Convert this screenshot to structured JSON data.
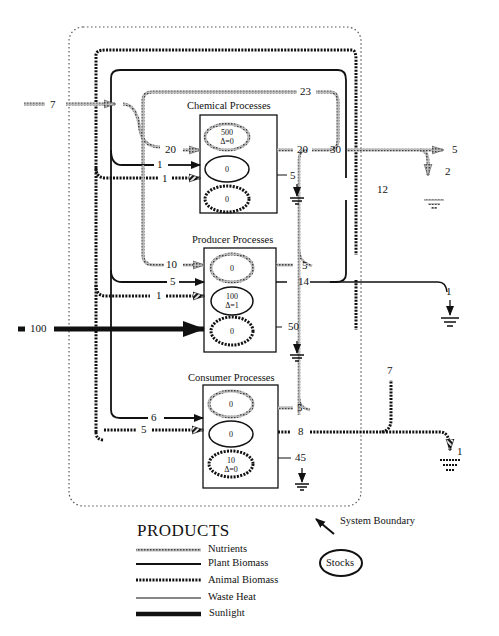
{
  "header": {
    "caption": "Ecological flow diagram of the global ecosystem"
  },
  "processes": {
    "chemical": {
      "title": "Chemical Processes",
      "stocks": [
        {
          "value": "500",
          "delta": "Δ=0"
        },
        {
          "value": "0",
          "delta": ""
        },
        {
          "value": "0",
          "delta": ""
        }
      ]
    },
    "producer": {
      "title": "Producer Processes",
      "stocks": [
        {
          "value": "0",
          "delta": ""
        },
        {
          "value": "100",
          "delta": "Δ=1"
        },
        {
          "value": "0",
          "delta": ""
        }
      ]
    },
    "consumer": {
      "title": "Consumer Processes",
      "stocks": [
        {
          "value": "0",
          "delta": ""
        },
        {
          "value": "0",
          "delta": ""
        },
        {
          "value": "10",
          "delta": "Δ=0"
        }
      ]
    }
  },
  "flows": {
    "external_nutrient_in": "7",
    "chem_in_nutrient": "20",
    "chem_in_plant": "1",
    "chem_in_animal": "1",
    "chem_out_nutrient": "20",
    "chem_heat": "5",
    "nutrient_loop_top": "23",
    "nutrient_junction": "30",
    "nutrient_export": "5",
    "nutrient_loss": "2",
    "plant_loop_right": "12",
    "prod_in_nutrient": "10",
    "prod_in_plant": "5",
    "prod_in_animal": "1",
    "prod_out_nutrient": "5",
    "prod_out_plant": "14",
    "prod_heat": "50",
    "plant_export": "1",
    "sunlight_in": "100",
    "cons_in_plant": "6",
    "cons_in_animal": "5",
    "cons_out_nutrient": "5",
    "cons_out_animal": "8",
    "cons_heat": "45",
    "animal_loop_right": "7",
    "animal_export": "1"
  },
  "system_boundary_label": "System Boundary",
  "legend": {
    "title": "PRODUCTS",
    "items": [
      {
        "label": "Nutrients",
        "style": "nutrients"
      },
      {
        "label": "Plant Biomass",
        "style": "plant"
      },
      {
        "label": "Animal Biomass",
        "style": "animal"
      },
      {
        "label": "Waste Heat",
        "style": "heat"
      },
      {
        "label": "Sunlight",
        "style": "sunlight"
      }
    ],
    "stocks_label": "Stocks"
  },
  "colors": {
    "ink": "#111111",
    "nutrient": "#888888",
    "boundary": "#555555"
  }
}
